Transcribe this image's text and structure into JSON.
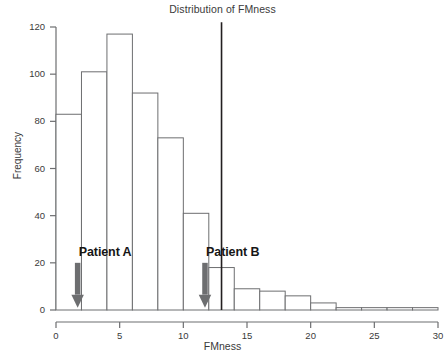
{
  "chart_data": {
    "type": "bar",
    "title": "Distribution of FMness",
    "xlabel": "FMness",
    "ylabel": "Frequency",
    "grid": false,
    "legend": "none",
    "bin_width": 2,
    "xlim": [
      0,
      30
    ],
    "ylim": [
      0,
      120
    ],
    "xticks": [
      0,
      5,
      10,
      15,
      20,
      25,
      30
    ],
    "yticks": [
      0,
      20,
      40,
      60,
      80,
      100,
      120
    ],
    "bin_starts": [
      0,
      2,
      4,
      6,
      8,
      10,
      12,
      14,
      16,
      18,
      20,
      22,
      24,
      26,
      28
    ],
    "categories": [
      "0-2",
      "2-4",
      "4-6",
      "6-8",
      "8-10",
      "10-12",
      "12-14",
      "14-16",
      "16-18",
      "18-20",
      "20-22",
      "22-24",
      "24-26",
      "26-28",
      "28-30"
    ],
    "values": [
      83,
      101,
      117,
      92,
      73,
      41,
      18,
      9,
      8,
      6,
      3,
      1,
      1,
      1,
      1
    ],
    "annotations": [
      {
        "label": "Patient A",
        "x": 1.7,
        "label_x": 2.1,
        "label_y": 24,
        "arrow_top": 20,
        "arrow_bottom": 1
      },
      {
        "label": "Patient B",
        "x": 11.7,
        "label_x": 12.1,
        "label_y": 24,
        "arrow_top": 20,
        "arrow_bottom": 1
      }
    ],
    "reference_line": {
      "x": 13,
      "y_top": 122,
      "y_bottom": 0
    }
  },
  "colors": {
    "bar_fill": "#ffffff",
    "bar_edge": "#6d6e70",
    "axis": "#6d6e70",
    "arrow": "#6d6e70",
    "reference_line": "#231f20",
    "text": "#3a3a3a",
    "annotation_text": "#161616"
  }
}
